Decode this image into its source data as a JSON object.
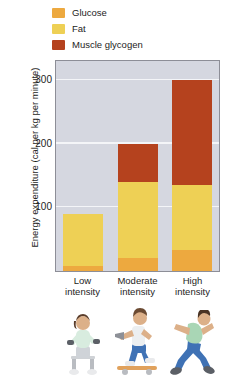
{
  "chart_data": {
    "type": "bar",
    "title": "",
    "xlabel": "",
    "ylabel": "Energy expenditure (cal per kg per minute)",
    "categories": [
      "Low intensity",
      "Moderate intensity",
      "High intensity"
    ],
    "ylim": [
      0,
      330
    ],
    "yticks": [
      100,
      200,
      300
    ],
    "grid": true,
    "stacked": true,
    "legend_position": "top-left",
    "series": [
      {
        "name": "Glucose",
        "color": "#eda93f",
        "values": [
          8,
          20,
          33
        ]
      },
      {
        "name": "Fat",
        "color": "#eed055",
        "values": [
          82,
          120,
          102
        ]
      },
      {
        "name": "Muscle glycogen",
        "color": "#b5421e",
        "values": [
          0,
          60,
          165
        ]
      }
    ],
    "totals": [
      90,
      200,
      300
    ]
  },
  "legend": {
    "items": [
      {
        "label": "Glucose",
        "color": "#eda93f"
      },
      {
        "label": "Fat",
        "color": "#eed055"
      },
      {
        "label": "Muscle glycogen",
        "color": "#b5421e"
      }
    ]
  },
  "yaxis": {
    "label": "Energy expenditure (cal per kg per minute)",
    "ticks": [
      "300",
      "200",
      "100"
    ]
  },
  "xaxis": {
    "categories": [
      {
        "line1": "Low",
        "line2": "intensity"
      },
      {
        "line1": "Moderate",
        "line2": "intensity"
      },
      {
        "line1": "High",
        "line2": "intensity"
      }
    ]
  },
  "illustrations": [
    {
      "name": "seated-weight-lifting-figure",
      "activity": "Low intensity"
    },
    {
      "name": "skateboarding-figure",
      "activity": "Moderate intensity"
    },
    {
      "name": "running-figure",
      "activity": "High intensity"
    }
  ],
  "colors": {
    "plot_background": "#d5d7e0",
    "gridline": "#f4f5f8",
    "plot_border": "#8d8e97",
    "text": "#1d1d1b"
  }
}
